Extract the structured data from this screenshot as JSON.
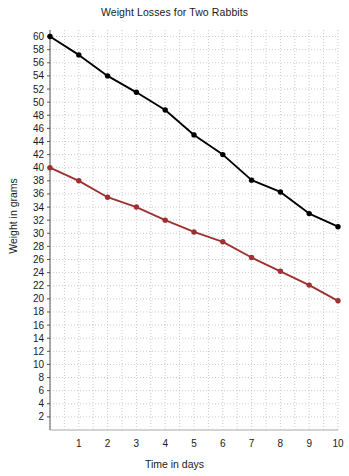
{
  "chart_data": {
    "type": "line",
    "title": "Weight Losses for Two Rabbits",
    "xlabel": "Time in days",
    "ylabel": "Weight in grams",
    "xlim": [
      0,
      10
    ],
    "ylim": [
      0,
      61
    ],
    "grid": true,
    "grid_style": "dotted",
    "grid_color": "#cccccc",
    "legend": "none",
    "x": [
      0,
      1,
      2,
      3,
      4,
      5,
      6,
      7,
      8,
      9,
      10
    ],
    "xticks": [
      1,
      2,
      3,
      4,
      5,
      6,
      7,
      8,
      9,
      10
    ],
    "xticklabels": [
      "1",
      "2",
      "3",
      "4",
      "5",
      "6",
      "7",
      "8",
      "9",
      "10"
    ],
    "yticks": [
      2,
      4,
      6,
      8,
      10,
      12,
      14,
      16,
      18,
      20,
      22,
      24,
      26,
      28,
      30,
      32,
      34,
      36,
      38,
      40,
      42,
      44,
      46,
      48,
      50,
      52,
      54,
      56,
      58,
      60
    ],
    "yticklabels": [
      "2",
      "4",
      "6",
      "8",
      "10",
      "12",
      "14",
      "16",
      "18",
      "20",
      "22",
      "24",
      "26",
      "28",
      "30",
      "32",
      "34",
      "36",
      "38",
      "40",
      "42",
      "44",
      "46",
      "48",
      "50",
      "52",
      "54",
      "56",
      "58",
      "60"
    ],
    "series": [
      {
        "name": "rabbit-black",
        "color": "#000000",
        "marker": "circle",
        "values": [
          60,
          57.2,
          54,
          51.5,
          48.8,
          45,
          42,
          38.1,
          36.3,
          33,
          31
        ]
      },
      {
        "name": "rabbit-red",
        "color": "#9e3232",
        "marker": "circle",
        "values": [
          40,
          38,
          35.5,
          34,
          32,
          30.2,
          28.7,
          26.3,
          24.2,
          22.1,
          19.7
        ]
      }
    ]
  }
}
